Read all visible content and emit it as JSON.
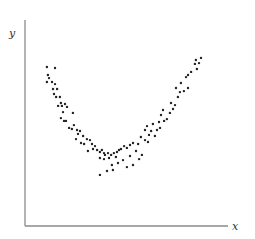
{
  "chart_data": {
    "type": "scatter",
    "title": "",
    "xlabel": "x",
    "ylabel": "y",
    "xlim": [
      0,
      1
    ],
    "ylim": [
      0,
      1
    ],
    "grid": false,
    "legend": null,
    "ticks": false,
    "series": [
      {
        "name": "points",
        "color": "#222222",
        "points": [
          [
            0.108,
            0.772
          ],
          [
            0.148,
            0.767
          ],
          [
            0.113,
            0.733
          ],
          [
            0.118,
            0.718
          ],
          [
            0.108,
            0.699
          ],
          [
            0.133,
            0.699
          ],
          [
            0.148,
            0.689
          ],
          [
            0.138,
            0.665
          ],
          [
            0.158,
            0.665
          ],
          [
            0.143,
            0.641
          ],
          [
            0.153,
            0.626
          ],
          [
            0.172,
            0.626
          ],
          [
            0.177,
            0.597
          ],
          [
            0.197,
            0.592
          ],
          [
            0.163,
            0.583
          ],
          [
            0.182,
            0.583
          ],
          [
            0.207,
            0.578
          ],
          [
            0.187,
            0.553
          ],
          [
            0.236,
            0.549
          ],
          [
            0.177,
            0.524
          ],
          [
            0.202,
            0.51
          ],
          [
            0.192,
            0.51
          ],
          [
            0.241,
            0.49
          ],
          [
            0.217,
            0.476
          ],
          [
            0.231,
            0.471
          ],
          [
            0.256,
            0.466
          ],
          [
            0.271,
            0.461
          ],
          [
            0.261,
            0.447
          ],
          [
            0.286,
            0.437
          ],
          [
            0.251,
            0.422
          ],
          [
            0.305,
            0.422
          ],
          [
            0.32,
            0.417
          ],
          [
            0.276,
            0.403
          ],
          [
            0.291,
            0.398
          ],
          [
            0.33,
            0.398
          ],
          [
            0.345,
            0.388
          ],
          [
            0.335,
            0.374
          ],
          [
            0.355,
            0.369
          ],
          [
            0.379,
            0.369
          ],
          [
            0.31,
            0.364
          ],
          [
            0.369,
            0.359
          ],
          [
            0.389,
            0.354
          ],
          [
            0.394,
            0.345
          ],
          [
            0.409,
            0.354
          ],
          [
            0.424,
            0.345
          ],
          [
            0.438,
            0.354
          ],
          [
            0.369,
            0.33
          ],
          [
            0.389,
            0.325
          ],
          [
            0.414,
            0.33
          ],
          [
            0.448,
            0.335
          ],
          [
            0.453,
            0.359
          ],
          [
            0.463,
            0.369
          ],
          [
            0.473,
            0.374
          ],
          [
            0.488,
            0.388
          ],
          [
            0.502,
            0.379
          ],
          [
            0.517,
            0.393
          ],
          [
            0.532,
            0.403
          ],
          [
            0.428,
            0.296
          ],
          [
            0.404,
            0.267
          ],
          [
            0.433,
            0.272
          ],
          [
            0.369,
            0.248
          ],
          [
            0.458,
            0.306
          ],
          [
            0.483,
            0.32
          ],
          [
            0.517,
            0.34
          ],
          [
            0.547,
            0.364
          ],
          [
            0.502,
            0.286
          ],
          [
            0.532,
            0.296
          ],
          [
            0.562,
            0.325
          ],
          [
            0.576,
            0.345
          ],
          [
            0.557,
            0.398
          ],
          [
            0.591,
            0.417
          ],
          [
            0.606,
            0.408
          ],
          [
            0.571,
            0.432
          ],
          [
            0.611,
            0.442
          ],
          [
            0.64,
            0.437
          ],
          [
            0.621,
            0.461
          ],
          [
            0.65,
            0.466
          ],
          [
            0.601,
            0.485
          ],
          [
            0.665,
            0.476
          ],
          [
            0.63,
            0.495
          ],
          [
            0.66,
            0.505
          ],
          [
            0.591,
            0.466
          ],
          [
            0.685,
            0.51
          ],
          [
            0.67,
            0.539
          ],
          [
            0.699,
            0.519
          ],
          [
            0.714,
            0.549
          ],
          [
            0.68,
            0.563
          ],
          [
            0.729,
            0.568
          ],
          [
            0.739,
            0.587
          ],
          [
            0.719,
            0.597
          ],
          [
            0.753,
            0.626
          ],
          [
            0.763,
            0.65
          ],
          [
            0.744,
            0.67
          ],
          [
            0.783,
            0.655
          ],
          [
            0.803,
            0.67
          ],
          [
            0.768,
            0.694
          ],
          [
            0.793,
            0.723
          ],
          [
            0.803,
            0.733
          ],
          [
            0.818,
            0.748
          ],
          [
            0.847,
            0.762
          ],
          [
            0.837,
            0.787
          ],
          [
            0.857,
            0.791
          ],
          [
            0.842,
            0.806
          ],
          [
            0.867,
            0.816
          ]
        ]
      }
    ]
  },
  "layout": {
    "plot_left": 25,
    "plot_right": 228,
    "plot_top": 20,
    "plot_bottom": 226,
    "axis_color": "#8a8a8a",
    "point_radius": 1.2
  }
}
